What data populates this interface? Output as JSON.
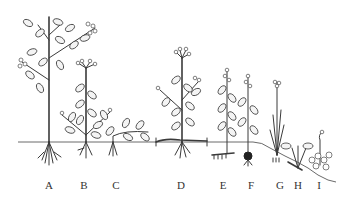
{
  "figure": {
    "labels": [
      {
        "id": "A",
        "text": "A",
        "x": 49
      },
      {
        "id": "B",
        "text": "B",
        "x": 84
      },
      {
        "id": "C",
        "text": "C",
        "x": 116
      },
      {
        "id": "D",
        "text": "D",
        "x": 181
      },
      {
        "id": "E",
        "text": "E",
        "x": 223
      },
      {
        "id": "F",
        "text": "F",
        "x": 251
      },
      {
        "id": "G",
        "text": "G",
        "x": 280
      },
      {
        "id": "H",
        "text": "H",
        "x": 298
      },
      {
        "id": "I",
        "text": "I",
        "x": 319
      }
    ],
    "colors": {
      "ink": "#3a3a3a",
      "background": "#ffffff",
      "ground": "#6a6a6a"
    }
  }
}
